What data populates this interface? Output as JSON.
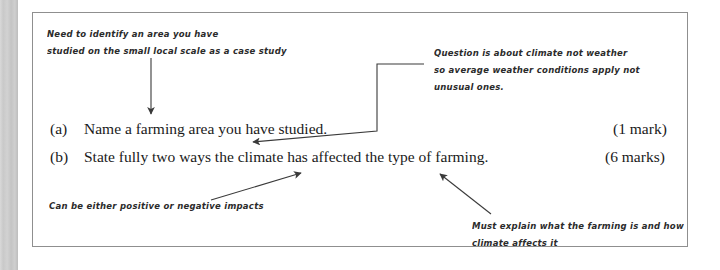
{
  "document": {
    "type": "annotated-exam-question",
    "frame_border_color": "#8f8f8f",
    "printed_text_color": "#1a1a1a",
    "handwriting_color": "#2b2b2b"
  },
  "questions": [
    {
      "label": "(a)",
      "text": "Name a farming area you have studied.",
      "marks": "(1 mark)"
    },
    {
      "label": "(b)",
      "text": "State fully two ways the climate has affected the type of farming.",
      "marks": "(6 marks)"
    }
  ],
  "annotations": [
    {
      "id": "identify-area",
      "line1": "Need to identify an area you have",
      "line2": "studied on the small local scale as a case study"
    },
    {
      "id": "climate-not-weather",
      "line1": "Question is about climate not weather",
      "line2": "so average weather conditions apply not",
      "line3": "unusual ones."
    },
    {
      "id": "positive-negative",
      "line1": "Can be either positive or negative impacts"
    },
    {
      "id": "explain-farming",
      "line1": "Must explain what the farming is and how",
      "line2": "climate affects it"
    }
  ]
}
